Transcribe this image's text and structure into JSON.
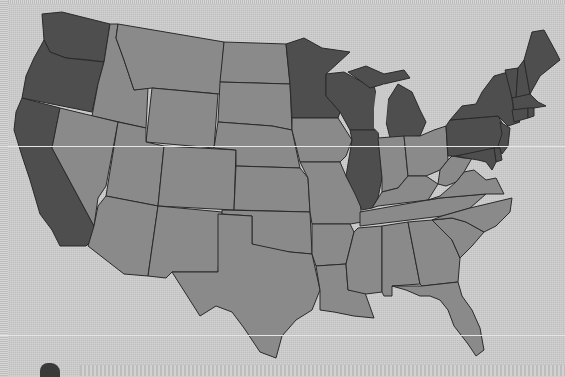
{
  "map": {
    "title": "",
    "colors": {
      "background": "#cdcdcd",
      "highlighted": "#4e4e4e",
      "default": "#8a8a8a",
      "border": "#2a2a2a"
    },
    "legend": [],
    "highlighted_states": [
      "WA",
      "OR",
      "CA",
      "MN",
      "WI",
      "IL",
      "MI",
      "NY",
      "PA",
      "NJ",
      "DE",
      "MD",
      "VT",
      "NH",
      "ME",
      "MA",
      "CT",
      "RI"
    ],
    "states": [
      {
        "code": "WA",
        "name": "Washington",
        "highlighted": true
      },
      {
        "code": "OR",
        "name": "Oregon",
        "highlighted": true
      },
      {
        "code": "CA",
        "name": "California",
        "highlighted": true
      },
      {
        "code": "ID",
        "name": "Idaho",
        "highlighted": false
      },
      {
        "code": "NV",
        "name": "Nevada",
        "highlighted": false
      },
      {
        "code": "MT",
        "name": "Montana",
        "highlighted": false
      },
      {
        "code": "WY",
        "name": "Wyoming",
        "highlighted": false
      },
      {
        "code": "UT",
        "name": "Utah",
        "highlighted": false
      },
      {
        "code": "AZ",
        "name": "Arizona",
        "highlighted": false
      },
      {
        "code": "CO",
        "name": "Colorado",
        "highlighted": false
      },
      {
        "code": "NM",
        "name": "New Mexico",
        "highlighted": false
      },
      {
        "code": "ND",
        "name": "North Dakota",
        "highlighted": false
      },
      {
        "code": "SD",
        "name": "South Dakota",
        "highlighted": false
      },
      {
        "code": "NE",
        "name": "Nebraska",
        "highlighted": false
      },
      {
        "code": "KS",
        "name": "Kansas",
        "highlighted": false
      },
      {
        "code": "OK",
        "name": "Oklahoma",
        "highlighted": false
      },
      {
        "code": "TX",
        "name": "Texas",
        "highlighted": false
      },
      {
        "code": "MN",
        "name": "Minnesota",
        "highlighted": true
      },
      {
        "code": "IA",
        "name": "Iowa",
        "highlighted": false
      },
      {
        "code": "MO",
        "name": "Missouri",
        "highlighted": false
      },
      {
        "code": "AR",
        "name": "Arkansas",
        "highlighted": false
      },
      {
        "code": "LA",
        "name": "Louisiana",
        "highlighted": false
      },
      {
        "code": "WI",
        "name": "Wisconsin",
        "highlighted": true
      },
      {
        "code": "IL",
        "name": "Illinois",
        "highlighted": true
      },
      {
        "code": "MI",
        "name": "Michigan",
        "highlighted": true
      },
      {
        "code": "IN",
        "name": "Indiana",
        "highlighted": false
      },
      {
        "code": "OH",
        "name": "Ohio",
        "highlighted": false
      },
      {
        "code": "KY",
        "name": "Kentucky",
        "highlighted": false
      },
      {
        "code": "TN",
        "name": "Tennessee",
        "highlighted": false
      },
      {
        "code": "MS",
        "name": "Mississippi",
        "highlighted": false
      },
      {
        "code": "AL",
        "name": "Alabama",
        "highlighted": false
      },
      {
        "code": "GA",
        "name": "Georgia",
        "highlighted": false
      },
      {
        "code": "FL",
        "name": "Florida",
        "highlighted": false
      },
      {
        "code": "SC",
        "name": "South Carolina",
        "highlighted": false
      },
      {
        "code": "NC",
        "name": "North Carolina",
        "highlighted": false
      },
      {
        "code": "VA",
        "name": "Virginia",
        "highlighted": false
      },
      {
        "code": "WV",
        "name": "West Virginia",
        "highlighted": false
      },
      {
        "code": "PA",
        "name": "Pennsylvania",
        "highlighted": true
      },
      {
        "code": "NY",
        "name": "New York",
        "highlighted": true
      },
      {
        "code": "NJ",
        "name": "New Jersey",
        "highlighted": true
      },
      {
        "code": "DE",
        "name": "Delaware",
        "highlighted": true
      },
      {
        "code": "MD",
        "name": "Maryland",
        "highlighted": true
      },
      {
        "code": "VT",
        "name": "Vermont",
        "highlighted": true
      },
      {
        "code": "NH",
        "name": "New Hampshire",
        "highlighted": true
      },
      {
        "code": "ME",
        "name": "Maine",
        "highlighted": true
      },
      {
        "code": "MA",
        "name": "Massachusetts",
        "highlighted": true
      },
      {
        "code": "CT",
        "name": "Connecticut",
        "highlighted": true
      },
      {
        "code": "RI",
        "name": "Rhode Island",
        "highlighted": true
      }
    ]
  }
}
